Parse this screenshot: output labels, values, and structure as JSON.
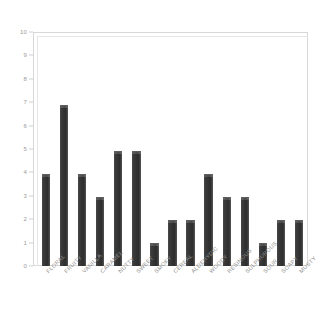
{
  "chart_data": {
    "type": "bar",
    "title": "",
    "subtitle": "",
    "xlabel": "",
    "ylabel": "",
    "ylim": [
      0,
      10
    ],
    "yticks": [
      0,
      1,
      2,
      3,
      4,
      5,
      6,
      7,
      8,
      9,
      10
    ],
    "ytick_labels": [
      "0",
      "1",
      "2",
      "3",
      "4",
      "5",
      "6",
      "7",
      "8",
      "9",
      "10"
    ],
    "grid": false,
    "legend": null,
    "legend_position": "none",
    "categories": [
      "FLORAL",
      "FRUITY",
      "VANILLA",
      "CARAMEL",
      "NUTTY",
      "SWEET",
      "SMOKY",
      "CEREAL",
      "ALDEHYDIC",
      "WOODY",
      "RESINOUS",
      "SULPHUROUS",
      "SOUR",
      "SOAPY",
      "MUSTY"
    ],
    "values": [
      4,
      7,
      4,
      3,
      5,
      5,
      1,
      2,
      2,
      4,
      3,
      3,
      1,
      2,
      2
    ],
    "series": [
      {
        "name": "",
        "values": [
          4,
          7,
          4,
          3,
          5,
          5,
          1,
          2,
          2,
          4,
          3,
          3,
          1,
          2,
          2
        ]
      }
    ],
    "colors": {
      "bar_fill": "#333333",
      "bar_highlight": "#5e5e5e",
      "axis_line": "#d8d8d8",
      "tick_text": "#9a9a9a",
      "label_text": "#8f8f8f",
      "background": "#ffffff"
    }
  }
}
